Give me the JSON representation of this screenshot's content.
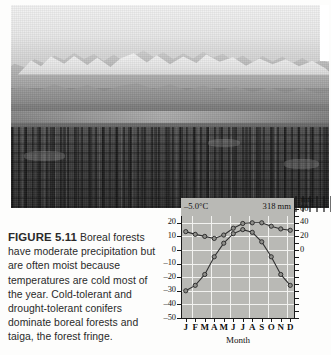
{
  "figure": {
    "caption_label": "FIGURE 5.11",
    "caption_text": " Boreal forests have moderate precipitation but are often moist because temperatures are cold most of the year. Cold-tolerant and drought-tolerant conifers dominate boreal forests and taiga, the forest fringe."
  },
  "photo": {
    "alt_name": "boreal-forest-mountain-photograph",
    "description": "Snow-capped mountain range above a broad valley with dense dark conifer forest in the foreground"
  },
  "chart_header": {
    "mean_temperature": "–5.0°C",
    "total_precipitation": "318 mm"
  },
  "chart_data": {
    "type": "line",
    "title": "",
    "subtitle": "",
    "xlabel": "Month",
    "ylabel": "",
    "y2label": "mm",
    "grid": true,
    "legend": "none",
    "categories": [
      "J",
      "F",
      "M",
      "A",
      "M",
      "J",
      "J",
      "A",
      "S",
      "O",
      "N",
      "D"
    ],
    "ylim": [
      -50,
      25
    ],
    "yticks": [
      "20",
      "10",
      "0",
      "–10",
      "–20",
      "–30",
      "–40",
      "–50"
    ],
    "y2lim": [
      -100,
      50
    ],
    "y2ticks": [
      "60",
      "40",
      "20",
      "0"
    ],
    "series": [
      {
        "name": "precipitation",
        "axis": "right",
        "unit": "mm",
        "values": [
          27,
          23,
          20,
          17,
          22,
          32,
          39,
          40,
          40,
          35,
          31,
          29
        ]
      },
      {
        "name": "temperature",
        "axis": "left",
        "unit": "°C",
        "values": [
          -30,
          -26,
          -18,
          -5,
          5,
          12,
          15,
          13,
          6,
          -5,
          -18,
          -26
        ]
      }
    ]
  },
  "colors": {
    "plot_background": "#b9b9b5",
    "gridline": "#f2f2f0",
    "axis": "#1a1a1a",
    "series_line": "#303030",
    "marker_fill": "#8f8f8b",
    "page_background": "#fdfdfc",
    "caption_text": "#2a2a2a"
  }
}
